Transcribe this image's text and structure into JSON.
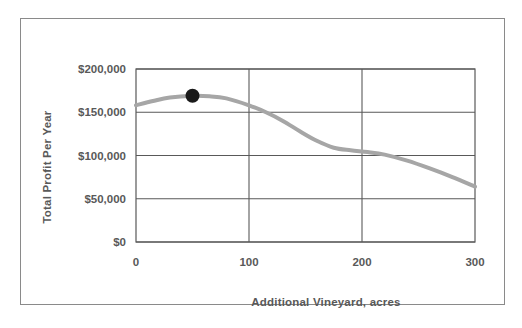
{
  "chart_data": {
    "type": "line",
    "title": "",
    "xlabel": "Additional Vineyard, acres",
    "ylabel": "Total Profit Per Year",
    "xlim": [
      0,
      300
    ],
    "ylim": [
      0,
      200000
    ],
    "grid": true,
    "legend": "none",
    "x_ticks": [
      "0",
      "100",
      "200",
      "300"
    ],
    "x_tick_values": [
      0,
      100,
      200,
      300
    ],
    "y_ticks": [
      "$0",
      "$50,000",
      "$100,000",
      "$150,000",
      "$200,000"
    ],
    "y_tick_values": [
      0,
      50000,
      100000,
      150000,
      200000
    ],
    "series": [
      {
        "name": "Total Profit Per Year",
        "color": "#a6a6a6",
        "line_width": 4,
        "x": [
          0,
          15,
          30,
          50,
          65,
          80,
          100,
          115,
          130,
          145,
          160,
          175,
          190,
          205,
          220,
          240,
          260,
          280,
          300
        ],
        "values": [
          158000,
          163000,
          167000,
          169000,
          168500,
          166000,
          158000,
          150000,
          140000,
          128000,
          117000,
          109000,
          106000,
          104000,
          101000,
          94000,
          85000,
          75000,
          64000
        ]
      }
    ],
    "markers": [
      {
        "name": "optimum-point",
        "x": 50,
        "y": 169000,
        "color": "#1a1a1a",
        "radius": 7
      }
    ]
  },
  "axis_titles": {
    "y": "Total Profit Per Year",
    "x": "Additional Vineyard, acres"
  },
  "colors": {
    "frame_border": "#8a8a8a",
    "plot_border": "#595959",
    "gridline": "#595959",
    "curve": "#a6a6a6",
    "marker": "#1a1a1a",
    "text": "#595959",
    "background": "#ffffff"
  }
}
